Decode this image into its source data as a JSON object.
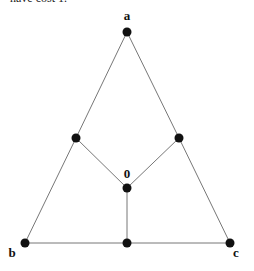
{
  "caption": "have cost 1.",
  "colors": {
    "edge": "#777777",
    "node": "#111111",
    "label": "#111111"
  },
  "graph": {
    "nodes": [
      {
        "id": "a",
        "label": "a",
        "x": 127,
        "y": 32,
        "lx": 127,
        "ly": 20
      },
      {
        "id": "m1",
        "label": "",
        "x": 76,
        "y": 138
      },
      {
        "id": "m2",
        "label": "",
        "x": 179,
        "y": 138
      },
      {
        "id": "o",
        "label": "0",
        "x": 127,
        "y": 188,
        "lx": 127,
        "ly": 178
      },
      {
        "id": "b",
        "label": "b",
        "x": 25,
        "y": 243,
        "lx": 12,
        "ly": 257
      },
      {
        "id": "m3",
        "label": "",
        "x": 127,
        "y": 243
      },
      {
        "id": "c",
        "label": "c",
        "x": 230,
        "y": 243,
        "lx": 236,
        "ly": 257
      }
    ],
    "edges": [
      [
        "a",
        "m1"
      ],
      [
        "m1",
        "b"
      ],
      [
        "a",
        "m2"
      ],
      [
        "m2",
        "c"
      ],
      [
        "b",
        "m3"
      ],
      [
        "m3",
        "c"
      ],
      [
        "m1",
        "o"
      ],
      [
        "m2",
        "o"
      ],
      [
        "o",
        "m3"
      ]
    ]
  }
}
